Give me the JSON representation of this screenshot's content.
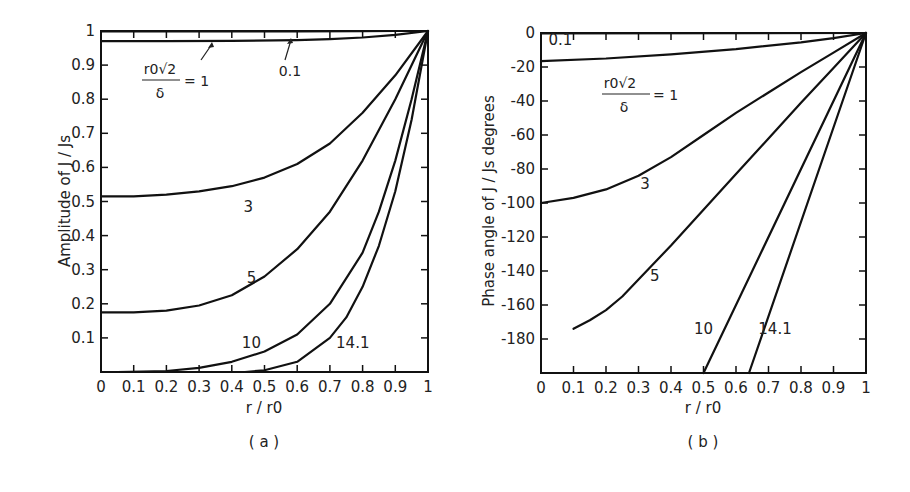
{
  "chart_data": [
    {
      "type": "line",
      "panel": "(a)",
      "title": "",
      "xlabel": "r / r0",
      "ylabel": "Amplitude of J/Js",
      "xlim": [
        0,
        1
      ],
      "ylim": [
        0,
        1
      ],
      "xticks": [
        "0",
        "0.1",
        "0.2",
        "0.3",
        "0.4",
        "0.5",
        "0.6",
        "0.7",
        "0.8",
        "0.9",
        "1"
      ],
      "yticks": [
        "0.1",
        "0.2",
        "0.3",
        "0.4",
        "0.5",
        "0.6",
        "0.7",
        "0.8",
        "0.9",
        "1"
      ],
      "grid": false,
      "parameter_label": "r0√2/δ = 1",
      "series": [
        {
          "name": "0.1",
          "x": [
            0,
            0.2,
            0.4,
            0.6,
            0.8,
            0.9,
            1.0
          ],
          "y": [
            0.999,
            0.999,
            0.999,
            0.999,
            0.9995,
            1.0,
            1.0
          ]
        },
        {
          "name": "1",
          "x": [
            0,
            0.2,
            0.4,
            0.6,
            0.7,
            0.8,
            0.9,
            1.0
          ],
          "y": [
            0.97,
            0.97,
            0.971,
            0.973,
            0.976,
            0.981,
            0.989,
            1.0
          ]
        },
        {
          "name": "3",
          "x": [
            0,
            0.1,
            0.2,
            0.3,
            0.4,
            0.5,
            0.6,
            0.7,
            0.8,
            0.9,
            1.0
          ],
          "y": [
            0.515,
            0.515,
            0.52,
            0.53,
            0.545,
            0.57,
            0.61,
            0.67,
            0.76,
            0.87,
            1.0
          ]
        },
        {
          "name": "5",
          "x": [
            0,
            0.1,
            0.2,
            0.3,
            0.4,
            0.5,
            0.6,
            0.7,
            0.8,
            0.9,
            1.0
          ],
          "y": [
            0.175,
            0.175,
            0.18,
            0.195,
            0.225,
            0.28,
            0.36,
            0.47,
            0.62,
            0.8,
            1.0
          ]
        },
        {
          "name": "10",
          "x": [
            0.05,
            0.2,
            0.3,
            0.4,
            0.5,
            0.6,
            0.7,
            0.8,
            0.85,
            0.9,
            0.95,
            1.0
          ],
          "y": [
            0.0,
            0.003,
            0.012,
            0.03,
            0.06,
            0.11,
            0.2,
            0.35,
            0.47,
            0.62,
            0.8,
            1.0
          ]
        },
        {
          "name": "14.1",
          "x": [
            0.44,
            0.5,
            0.6,
            0.7,
            0.75,
            0.8,
            0.85,
            0.9,
            0.95,
            1.0
          ],
          "y": [
            0.0,
            0.005,
            0.03,
            0.1,
            0.16,
            0.25,
            0.37,
            0.53,
            0.74,
            1.0
          ]
        }
      ],
      "curve_labels": [
        {
          "text": "3",
          "x": 0.45,
          "y": 0.47
        },
        {
          "text": "5",
          "x": 0.46,
          "y": 0.26
        },
        {
          "text": "10",
          "x": 0.46,
          "y": 0.07
        },
        {
          "text": "14.1",
          "x": 0.77,
          "y": 0.07
        },
        {
          "text": "0.1",
          "x": 0.6,
          "y": 0.89
        }
      ],
      "caption": "(a)"
    },
    {
      "type": "line",
      "panel": "(b)",
      "title": "",
      "xlabel": "r / r0",
      "ylabel": "Phase angle of J/Js degrees",
      "xlim": [
        0,
        1
      ],
      "ylim": [
        -200,
        0
      ],
      "xticks": [
        "0",
        "0.1",
        "0.2",
        "0.3",
        "0.4",
        "0.5",
        "0.6",
        "0.7",
        "0.8",
        "0.9",
        "1"
      ],
      "yticks": [
        "0",
        "-20",
        "-40",
        "-60",
        "-80",
        "-100",
        "-120",
        "-140",
        "-160",
        "-180"
      ],
      "grid": false,
      "parameter_label": "r0√2/δ = 1",
      "series": [
        {
          "name": "0.1",
          "x": [
            0,
            1.0
          ],
          "y": [
            -0.2,
            0
          ]
        },
        {
          "name": "1",
          "x": [
            0,
            0.2,
            0.4,
            0.6,
            0.8,
            0.9,
            1.0
          ],
          "y": [
            -16.5,
            -15,
            -12.5,
            -9.5,
            -5.5,
            -3,
            0
          ]
        },
        {
          "name": "3",
          "x": [
            0,
            0.1,
            0.2,
            0.3,
            0.4,
            0.5,
            0.6,
            0.7,
            0.8,
            0.9,
            1.0
          ],
          "y": [
            -100,
            -97,
            -92,
            -84,
            -73,
            -60,
            -47,
            -35,
            -23,
            -11.5,
            0
          ]
        },
        {
          "name": "5",
          "x": [
            0.1,
            0.15,
            0.2,
            0.25,
            0.3,
            0.4,
            0.5,
            0.6,
            0.7,
            0.8,
            0.9,
            1.0
          ],
          "y": [
            -174,
            -169,
            -163,
            -155,
            -145,
            -125,
            -104,
            -83,
            -62,
            -41,
            -20.5,
            0
          ]
        },
        {
          "name": "10",
          "x": [
            0.5,
            1.0
          ],
          "y": [
            -200,
            0
          ]
        },
        {
          "name": "14.1",
          "x": [
            0.64,
            1.0
          ],
          "y": [
            -200,
            0
          ]
        }
      ],
      "curve_labels": [
        {
          "text": "0.1",
          "x": 0.06,
          "y": -7
        },
        {
          "text": "3",
          "x": 0.32,
          "y": -92
        },
        {
          "text": "5",
          "x": 0.35,
          "y": -146
        },
        {
          "text": "10",
          "x": 0.5,
          "y": -177
        },
        {
          "text": "14.1",
          "x": 0.72,
          "y": -177
        }
      ],
      "caption": "(b)"
    }
  ],
  "labels": {
    "a": {
      "ylabel": "Amplitude of  J / Js",
      "xlabel": "r / r0",
      "caption": "( a )",
      "param_num": "r0√2",
      "param_den": "δ",
      "param_eq": "= 1",
      "label_01": "0.1"
    },
    "b": {
      "ylabel": "Phase angle of  J / Js degrees",
      "xlabel": "r / r0",
      "caption": "( b )",
      "param_num": "r0√2",
      "param_den": "δ",
      "param_eq": "= 1",
      "label_01": "0.1"
    }
  }
}
